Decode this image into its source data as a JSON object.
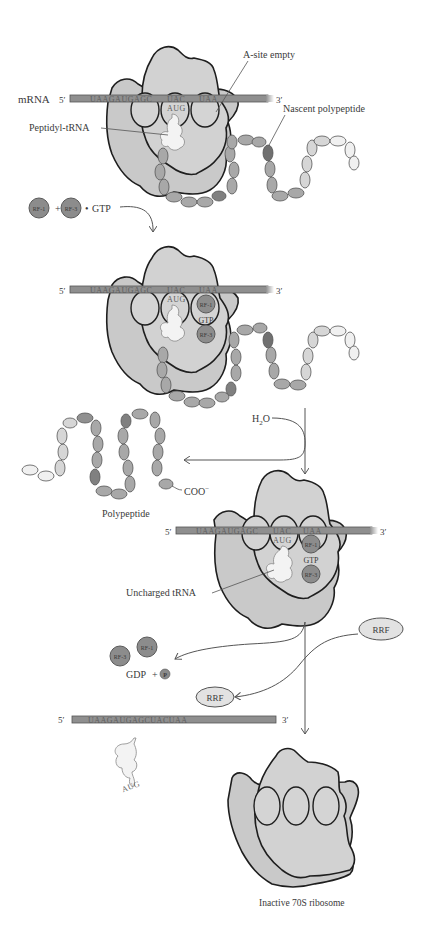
{
  "colors": {
    "ribosome_large": "#c9c9c9",
    "ribosome_small": "#d2d2d2",
    "mrna_bar": "#8f8f8f",
    "release_factor": "#8c8c8c",
    "rrf": "#e2e2e2",
    "outline": "#1e1e1e",
    "text": "#3a3a3a"
  },
  "stage1": {
    "mrna_label": "mRNA",
    "five_prime": "5′",
    "three_prime": "3′",
    "sequence_left": "UAAGAUGAGC",
    "codon_p": "UAC",
    "codon_a": "UAA",
    "anticodon": "AUG",
    "a_site_label": "A-site empty",
    "peptidyl_trna_label": "Peptidyl-tRNA",
    "nascent_label": "Nascent polypeptide"
  },
  "reagents1": {
    "rf1": "RF-1",
    "plus": "+",
    "rf3": "RF-3",
    "dot": "•",
    "gtp": "GTP"
  },
  "stage2": {
    "five_prime": "5′",
    "three_prime": "3′",
    "sequence_left": "UAAGAUGAGC",
    "codon_p": "UAC",
    "codon_a": "UAA",
    "anticodon": "AUG",
    "rf1": "RF-1",
    "gtp": "GTP",
    "rf3": "RF-3"
  },
  "hydrolysis": {
    "water_label": "H",
    "water_sub": "2",
    "water_o": "O",
    "released_label": "Polypeptide",
    "cterm_label": "COO",
    "cterm_sup": "−",
    "residues": [
      "Ser",
      "Asn",
      "Arg",
      "Ile",
      "Ala",
      "Glu",
      "His",
      "Met",
      "Asn",
      "Ser",
      "Gly",
      "Ile",
      "Gln",
      "Met",
      "Lys",
      "Asn",
      "Pro",
      "Glu",
      "His",
      "Thr",
      "Lys",
      "Arg",
      "Ser",
      "Tyr"
    ]
  },
  "stage3": {
    "five_prime": "5′",
    "three_prime": "3′",
    "sequence_left": "UAAGAUGAGC",
    "codon_p": "UAC",
    "codon_a": "UAA",
    "anticodon": "AUG",
    "rf1": "RF-1",
    "gtp": "GTP",
    "rf3": "RF-3",
    "uncharged_label": "Uncharged tRNA"
  },
  "release": {
    "rrf_in": "RRF",
    "rrf_out": "RRF",
    "rf3": "RF-3",
    "rf1": "RF-1",
    "gdp": "GDP",
    "plus": "+",
    "pi": "P",
    "free_mrna_five": "5′",
    "free_mrna_three": "3′",
    "free_mrna_sequence": "UAAGAUGAGCUACUAA",
    "free_trna_anticodon": "AUG"
  },
  "final": {
    "label": "Inactive 70S ribosome"
  }
}
